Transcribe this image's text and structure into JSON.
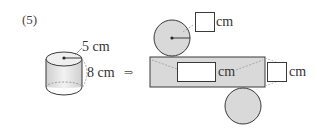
{
  "problem": {
    "number": "(5)"
  },
  "cylinder": {
    "radius_label": "5 cm",
    "height_label": "8 cm"
  },
  "arrow": {
    "glyph": "⇒"
  },
  "net": {
    "top_circle_unit": "cm",
    "rect_length_unit": "cm",
    "rect_height_unit": "cm",
    "answer_boxes": [
      {
        "id": "radius",
        "value": ""
      },
      {
        "id": "length",
        "value": ""
      },
      {
        "id": "height",
        "value": ""
      }
    ]
  },
  "colors": {
    "fill_gray": "#d9d9d9",
    "stroke": "#3a3a3a",
    "dashed": "#999999"
  }
}
